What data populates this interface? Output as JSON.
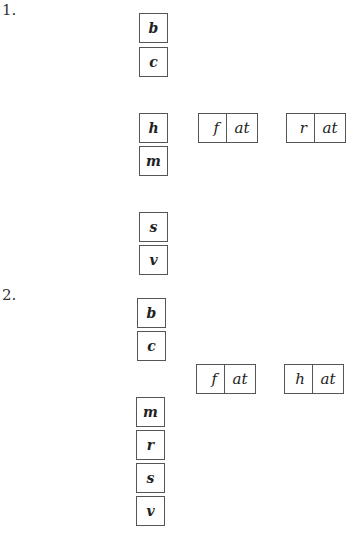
{
  "exercises": [
    {
      "number": "1.",
      "letter_tiles": [
        "b",
        "c",
        "h",
        "m",
        "s",
        "v"
      ],
      "words": [
        {
          "onset": "f",
          "rime": "at"
        },
        {
          "onset": "r",
          "rime": "at"
        }
      ]
    },
    {
      "number": "2.",
      "letter_tiles": [
        "b",
        "c",
        "m",
        "r",
        "s",
        "v"
      ],
      "words": [
        {
          "onset": "f",
          "rime": "at"
        },
        {
          "onset": "h",
          "rime": "at"
        }
      ]
    }
  ]
}
